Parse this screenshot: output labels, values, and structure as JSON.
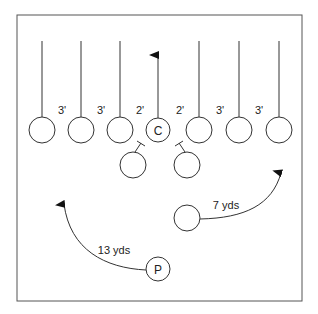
{
  "diagram": {
    "type": "football-formation",
    "frame": {
      "x": 17,
      "y": 15,
      "w": 285,
      "h": 286,
      "stroke": "#555555"
    },
    "line_color": "#333333",
    "linemen": [
      {
        "id": "l1",
        "cx": 42,
        "cy": 130,
        "r": 13,
        "label": "",
        "route_top": 41
      },
      {
        "id": "l2",
        "cx": 81,
        "cy": 130,
        "r": 13,
        "label": "",
        "route_top": 41
      },
      {
        "id": "l3",
        "cx": 120,
        "cy": 130,
        "r": 13,
        "label": "",
        "route_top": 41
      },
      {
        "id": "center",
        "cx": 158,
        "cy": 130,
        "r": 12,
        "label": "C",
        "route_top": 55,
        "arrow": true
      },
      {
        "id": "l5",
        "cx": 199,
        "cy": 130,
        "r": 13,
        "label": "",
        "route_top": 41
      },
      {
        "id": "l6",
        "cx": 239,
        "cy": 130,
        "r": 13,
        "label": "",
        "route_top": 41
      },
      {
        "id": "l7",
        "cx": 279,
        "cy": 130,
        "r": 13,
        "label": "",
        "route_top": 41
      }
    ],
    "splits": [
      {
        "x": 62,
        "y": 112,
        "label": "3'"
      },
      {
        "x": 101,
        "y": 112,
        "label": "3'"
      },
      {
        "x": 140,
        "y": 112,
        "label": "2'"
      },
      {
        "x": 180,
        "y": 112,
        "label": "2'"
      },
      {
        "x": 220,
        "y": 112,
        "label": "3'"
      },
      {
        "x": 259,
        "y": 112,
        "label": "3'"
      }
    ],
    "blockers": [
      {
        "id": "b1",
        "cx": 133,
        "cy": 165,
        "r": 13
      },
      {
        "id": "b2",
        "cx": 187,
        "cy": 165,
        "r": 13
      }
    ],
    "back": {
      "id": "back",
      "cx": 187,
      "cy": 218,
      "r": 13,
      "route_label": "7 yds"
    },
    "punter": {
      "id": "punter",
      "cx": 158,
      "cy": 269,
      "r": 12,
      "label": "P",
      "route_label": "13 yds"
    }
  }
}
